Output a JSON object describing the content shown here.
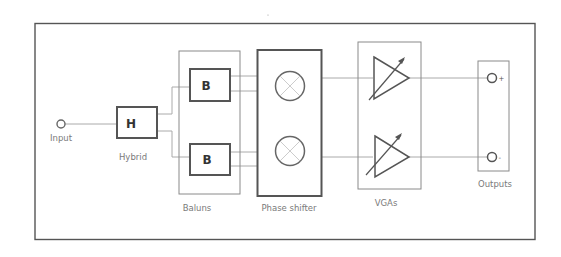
{
  "diagram": {
    "title": "",
    "colors": {
      "background": "#ffffff",
      "frame": "#555555",
      "block_border": "#555555",
      "group_border": "#8a8a8a",
      "wire": "#aaaaaa",
      "label_text": "#7a7a7a",
      "block_text": "#333333"
    },
    "input": {
      "label": "Input",
      "symbol": "circle-terminal"
    },
    "hybrid": {
      "glyph": "H",
      "label": "Hybrid"
    },
    "baluns": {
      "label": "Baluns",
      "blocks": [
        {
          "glyph": "B"
        },
        {
          "glyph": "B"
        }
      ]
    },
    "phase_shifter": {
      "label": "Phase shifter",
      "elements": [
        {
          "symbol": "mixer-x-circle"
        },
        {
          "symbol": "mixer-x-circle"
        }
      ]
    },
    "vgas": {
      "label": "VGAs",
      "elements": [
        {
          "symbol": "variable-gain-amplifier"
        },
        {
          "symbol": "variable-gain-amplifier"
        }
      ]
    },
    "outputs": {
      "label": "Outputs",
      "terminals": [
        {
          "polarity": "+"
        },
        {
          "polarity": "-"
        }
      ]
    },
    "signal_flow": [
      "Input",
      "Hybrid",
      "Baluns",
      "Phase shifter",
      "VGAs",
      "Outputs"
    ]
  }
}
